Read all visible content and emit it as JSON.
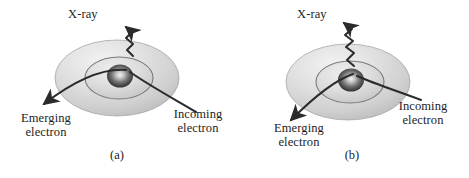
{
  "figure": {
    "background_color": "#ffffff",
    "stroke_color": "#2b2b2b",
    "shell_fill_outer": "#d8d8d8",
    "shell_fill_inner": "#cfcfcf",
    "nucleus_color": "#3a3a3a",
    "panels": [
      {
        "id": "a",
        "caption": "(a)",
        "xray_label": "X-ray",
        "emerging_label_line1": "Emerging",
        "emerging_label_line2": "electron",
        "incoming_label_line1": "Incoming",
        "incoming_label_line2": "electron"
      },
      {
        "id": "b",
        "caption": "(b)",
        "xray_label": "X-ray",
        "emerging_label_line1": "Emerging",
        "emerging_label_line2": "electron",
        "incoming_label_line1": "Incoming",
        "incoming_label_line2": "electron"
      }
    ]
  }
}
